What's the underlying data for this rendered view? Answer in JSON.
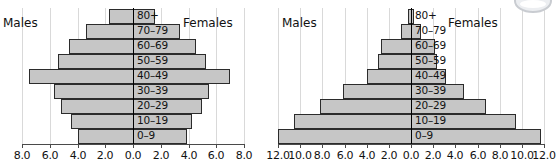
{
  "chart_data": [
    {
      "id": "left",
      "type": "bar",
      "subtype": "population-pyramid",
      "title": "",
      "xlabel": "",
      "ylabel": "",
      "left_caption": "Males",
      "right_caption": "Females",
      "categories": [
        "0–9",
        "10–19",
        "20–29",
        "30–39",
        "40–49",
        "50–59",
        "60–69",
        "70–79",
        "80+"
      ],
      "series": [
        {
          "name": "Males",
          "side": "left",
          "values": [
            4.0,
            4.5,
            5.2,
            5.7,
            7.5,
            5.4,
            4.6,
            3.4,
            1.7
          ]
        },
        {
          "name": "Females",
          "side": "right",
          "values": [
            3.8,
            4.2,
            4.9,
            5.4,
            6.9,
            5.2,
            4.5,
            3.3,
            1.5
          ]
        }
      ],
      "xlim": [
        -8.0,
        8.0
      ],
      "xticks": [
        -8.0,
        -6.0,
        -4.0,
        -2.0,
        0.0,
        2.0,
        4.0,
        6.0,
        8.0
      ],
      "xtick_labels": [
        "8.0",
        "6.0",
        "4.0",
        "2.0",
        "0.0",
        "2.0",
        "4.0",
        "6.0",
        "8.0"
      ],
      "grid": true,
      "legend": "none"
    },
    {
      "id": "right",
      "type": "bar",
      "subtype": "population-pyramid",
      "title": "",
      "xlabel": "",
      "ylabel": "",
      "left_caption": "Males",
      "right_caption": "Females",
      "categories": [
        "0–9",
        "10–19",
        "20–29",
        "30–39",
        "40–49",
        "50–59",
        "60–69",
        "70–79",
        "80+"
      ],
      "series": [
        {
          "name": "Males",
          "side": "left",
          "values": [
            12.0,
            10.6,
            8.2,
            6.1,
            4.0,
            3.0,
            2.7,
            0.9,
            0.3
          ]
        },
        {
          "name": "Females",
          "side": "right",
          "values": [
            11.6,
            9.4,
            6.7,
            4.7,
            3.1,
            2.3,
            2.1,
            0.8,
            0.2
          ]
        }
      ],
      "xlim": [
        -12.0,
        12.0
      ],
      "xticks": [
        -12.0,
        -10.0,
        -8.0,
        -6.0,
        -4.0,
        -2.0,
        0.0,
        2.0,
        4.0,
        6.0,
        8.0,
        10.0,
        12.0
      ],
      "xtick_labels": [
        "12.0",
        "10.0",
        "8.0",
        "6.0",
        "4.0",
        "2.0",
        "0.0",
        "2.0",
        "4.0",
        "6.0",
        "8.0",
        "10.0",
        "12.0"
      ],
      "grid": true,
      "legend": "none"
    }
  ],
  "style": {
    "bar_fill": "#c6c6c6",
    "bar_stroke": "#2b2b2b",
    "grid_color": "#d9d9d9",
    "axis_color": "#4a4a4a",
    "center_line_color": "#000000",
    "text_color": "#111111",
    "background": "#ffffff"
  }
}
